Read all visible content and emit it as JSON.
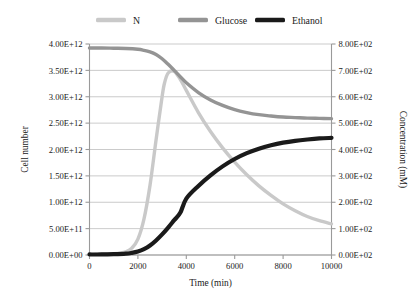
{
  "chart_data": {
    "type": "line",
    "title": "",
    "xlabel": "Time (min)",
    "ylabel": "Cell number",
    "y2label": "Concentration (mM)",
    "xlim": [
      0,
      10000
    ],
    "ylim": [
      0,
      4000000000000
    ],
    "y2lim": [
      0,
      800
    ],
    "grid": true,
    "legend_position": "top",
    "xticklabels": [
      "0",
      "2000",
      "4000",
      "6000",
      "8000",
      "10000"
    ],
    "xtickvalues": [
      0,
      2000,
      4000,
      6000,
      8000,
      10000
    ],
    "yticklabels": [
      "0.00E+00",
      "5.00E+11",
      "1.00E+12",
      "1.50E+12",
      "2.00E+12",
      "2.50E+12",
      "3.00E+12",
      "3.50E+12",
      "4.00E+12"
    ],
    "ytickvalues": [
      0,
      500000000000,
      1000000000000,
      1500000000000,
      2000000000000,
      2500000000000,
      3000000000000,
      3500000000000,
      4000000000000
    ],
    "y2ticklabels": [
      "0.00E+02",
      "1.00E+02",
      "2.00E+02",
      "3.00E+02",
      "4.00E+02",
      "5.00E+02",
      "6.00E+02",
      "7.00E+02",
      "8.00E+02"
    ],
    "y2tickvalues": [
      0,
      100,
      200,
      300,
      400,
      500,
      600,
      700,
      800
    ],
    "series": [
      {
        "name": "N",
        "color": "#c9c9c9",
        "axis": "left",
        "width": 3.4,
        "x": [
          0,
          250,
          500,
          750,
          1000,
          1250,
          1500,
          1750,
          2000,
          2250,
          2500,
          2750,
          3000,
          3100,
          3250,
          3500,
          3750,
          4000,
          4500,
          5000,
          5500,
          6000,
          6500,
          7000,
          7500,
          8000,
          8500,
          9000,
          9500,
          10000
        ],
        "y": [
          12000000000,
          13000000000,
          15000000000,
          18000000000,
          24000000000,
          36000000000,
          62000000000,
          130000000000,
          300000000000,
          680000000000,
          1320000000000,
          2180000000000,
          3000000000000,
          3260000000000,
          3450000000000,
          3480000000000,
          3330000000000,
          3120000000000,
          2700000000000,
          2340000000000,
          2030000000000,
          1760000000000,
          1520000000000,
          1310000000000,
          1130000000000,
          970000000000,
          840000000000,
          730000000000,
          650000000000,
          590000000000
        ]
      },
      {
        "name": "Glucose",
        "color": "#949494",
        "axis": "right",
        "width": 3.4,
        "x": [
          0,
          500,
          1000,
          1500,
          2000,
          2250,
          2500,
          2750,
          3000,
          3250,
          3500,
          3750,
          4000,
          4500,
          5000,
          5500,
          6000,
          6500,
          7000,
          7500,
          8000,
          8500,
          9000,
          9500,
          10000
        ],
        "y": [
          785,
          785,
          784,
          783,
          780,
          776,
          770,
          760,
          744,
          723,
          700,
          676,
          653,
          616,
          588,
          567,
          551,
          540,
          532,
          527,
          523,
          521,
          519,
          518,
          517
        ]
      },
      {
        "name": "Ethanol",
        "color": "#1a1a1a",
        "axis": "right",
        "width": 4.2,
        "x": [
          0,
          500,
          1000,
          1500,
          1750,
          2000,
          2250,
          2500,
          2750,
          3000,
          3250,
          3500,
          3750,
          4000,
          4500,
          5000,
          5500,
          6000,
          6500,
          7000,
          7500,
          8000,
          8500,
          9000,
          9500,
          10000
        ],
        "y": [
          2,
          2,
          3,
          5,
          8,
          13,
          22,
          36,
          55,
          78,
          104,
          132,
          160,
          214,
          262,
          302,
          336,
          364,
          386,
          403,
          416,
          426,
          433,
          438,
          442,
          444
        ]
      }
    ]
  },
  "legend": {
    "items": [
      {
        "label": "N",
        "color": "#c9c9c9"
      },
      {
        "label": "Glucose",
        "color": "#949494"
      },
      {
        "label": "Ethanol",
        "color": "#1a1a1a"
      }
    ]
  }
}
